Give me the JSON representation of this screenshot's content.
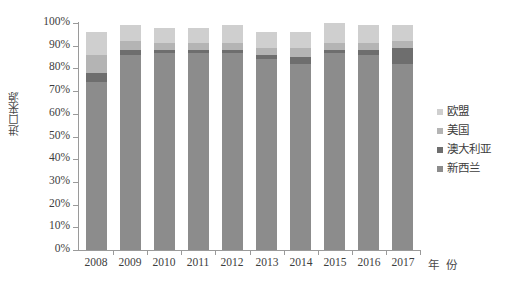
{
  "chart_data": {
    "type": "bar",
    "subtype": "100% stacked column",
    "title": "",
    "xlabel": "年 份",
    "ylabel": "进口来源",
    "categories": [
      "2008",
      "2009",
      "2010",
      "2011",
      "2012",
      "2013",
      "2014",
      "2015",
      "2016",
      "2017"
    ],
    "ylim": [
      0,
      100
    ],
    "ytick_labels": [
      "0%",
      "10%",
      "20%",
      "30%",
      "40%",
      "50%",
      "60%",
      "70%",
      "80%",
      "90%",
      "100%"
    ],
    "ytick_values": [
      0,
      10,
      20,
      30,
      40,
      50,
      60,
      70,
      80,
      90,
      100
    ],
    "grid": false,
    "legend_position": "right",
    "stack_order_bottom_to_top": [
      "新西兰",
      "澳大利亚",
      "美国",
      "欧盟"
    ],
    "series": [
      {
        "name": "新西兰",
        "color": "#8c8c8c",
        "values": [
          74,
          86,
          87,
          87,
          87,
          84,
          82,
          87,
          86,
          82
        ]
      },
      {
        "name": "澳大利亚",
        "color": "#6e6e6e",
        "values": [
          4,
          2,
          1,
          1,
          1,
          2,
          3,
          1,
          2,
          7
        ]
      },
      {
        "name": "美国",
        "color": "#b4b4b4",
        "values": [
          8,
          4,
          3,
          3,
          3,
          3,
          4,
          3,
          3,
          3
        ]
      },
      {
        "name": "欧盟",
        "color": "#cfcfcf",
        "values": [
          10,
          7,
          7,
          7,
          8,
          7,
          7,
          9,
          8,
          7
        ]
      }
    ],
    "bar_totals": [
      96,
      99,
      98,
      98,
      99,
      96,
      96,
      100,
      99,
      99
    ]
  },
  "legend": {
    "items": [
      {
        "label": "欧盟",
        "color": "#cfcfcf"
      },
      {
        "label": "美国",
        "color": "#b4b4b4"
      },
      {
        "label": "澳大利亚",
        "color": "#6e6e6e"
      },
      {
        "label": "新西兰",
        "color": "#8c8c8c"
      }
    ]
  },
  "axis": {
    "y_title": "进口来源",
    "x_title": "年 份"
  },
  "colors": {
    "axis_line": "#9a9a9a",
    "text": "#3d3d3d",
    "background": "#ffffff"
  }
}
